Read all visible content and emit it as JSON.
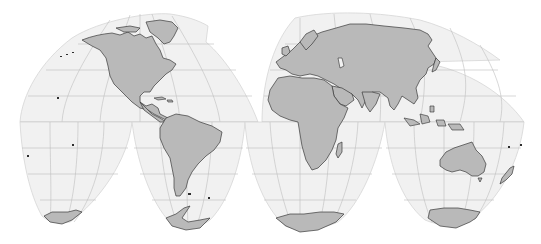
{
  "map": {
    "projection": "Goode homolosine (interrupted)",
    "colors": {
      "background": "#ffffff",
      "ocean": "#f1f1f1",
      "land": "#b9b9b9",
      "coastline": "#3a3a3a",
      "graticule": "#bdbdbd",
      "lobe_edge": "#d6d6d6"
    },
    "lobes": [
      {
        "name": "north-america-lobe",
        "hemisphere": "north"
      },
      {
        "name": "eurasia-lobe",
        "hemisphere": "north"
      },
      {
        "name": "south-pacific-lobe",
        "hemisphere": "south"
      },
      {
        "name": "south-america-lobe",
        "hemisphere": "south"
      },
      {
        "name": "africa-lobe",
        "hemisphere": "south"
      },
      {
        "name": "oceania-lobe",
        "hemisphere": "south"
      }
    ],
    "landmasses": [
      "North America",
      "Greenland",
      "South America",
      "Europe",
      "Asia",
      "Africa",
      "Madagascar",
      "Australia",
      "New Zealand",
      "Antarctica"
    ]
  }
}
